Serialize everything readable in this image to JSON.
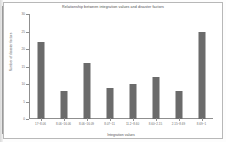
{
  "figure": {
    "border_color": "#b8b8b8",
    "background": "#ffffff"
  },
  "chart_data": {
    "type": "bar",
    "title": "Relationship between integration values and disaster factors",
    "xlabel": "Integration values",
    "ylabel": "Number of disaster factors",
    "categories": [
      "17~8.06",
      "8.06~16.06",
      "8.06~16.09",
      "8.07~11",
      "11.2~8.60",
      "8.60~2.15",
      "2.15~8.69",
      "8.69~1"
    ],
    "values": [
      22,
      8,
      16,
      9,
      10,
      12,
      8,
      25
    ],
    "ylim": [
      0,
      30
    ],
    "yticks": [
      0,
      5,
      10,
      15,
      20,
      25,
      30
    ],
    "ytick_labels": [
      "0",
      "5",
      "10",
      "15",
      "20",
      "25",
      "30"
    ],
    "grid": false,
    "legend": null,
    "bar_color": "#6b6b6b"
  }
}
